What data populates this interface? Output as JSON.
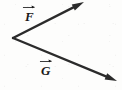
{
  "figure": {
    "kind": "vector-diagram",
    "background_color": "#fdfdfc",
    "stroke_color": "#2b2b2b",
    "label_color": "#1a1a1a",
    "width": 122,
    "height": 90
  },
  "vectors": [
    {
      "id": "F",
      "label": "F",
      "accent": "vector-arrow-accent",
      "tail": {
        "x": 13,
        "y": 38
      },
      "tip": {
        "x": 84,
        "y": 2
      },
      "label_position": {
        "x": 25,
        "y": 10
      },
      "direction": "up-right"
    },
    {
      "id": "G",
      "label": "G",
      "accent": "vector-arrow-accent",
      "tail": {
        "x": 13,
        "y": 38
      },
      "tip": {
        "x": 117,
        "y": 81
      },
      "label_position": {
        "x": 41,
        "y": 64
      },
      "direction": "down-right"
    }
  ]
}
